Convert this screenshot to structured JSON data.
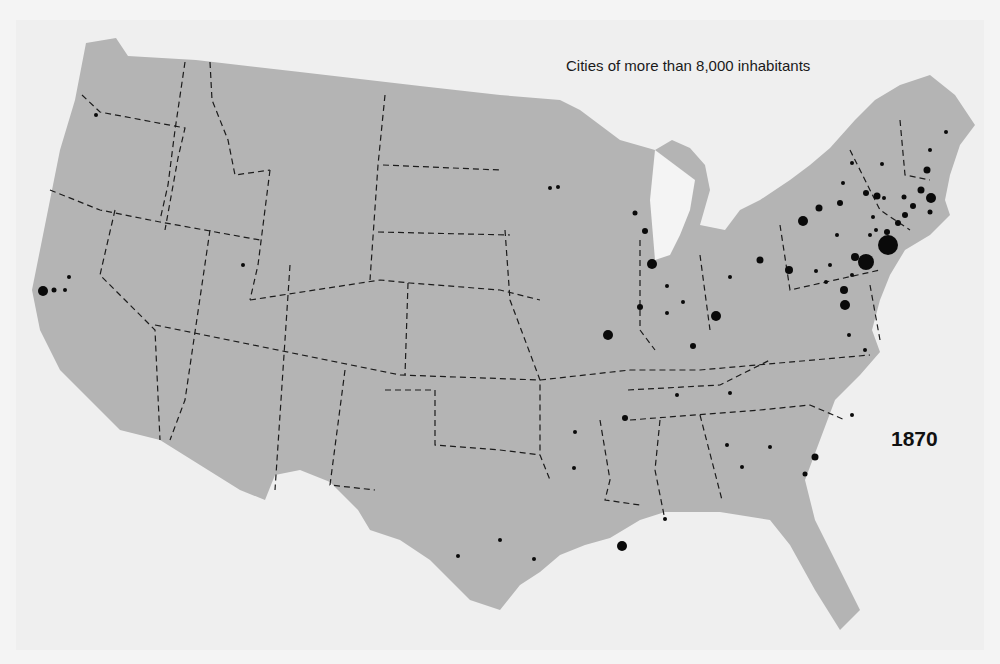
{
  "map": {
    "title": "Cities of more than 8,000 inhabitants",
    "year": "1870",
    "colors": {
      "land": "#b4b4b4",
      "water": "#f4f4f4",
      "city": "#0a0a0a",
      "border": "#1c1c1c"
    },
    "cities": [
      [
        43,
        291,
        6
      ],
      [
        54,
        290,
        3
      ],
      [
        65,
        290,
        2
      ],
      [
        69,
        277,
        2
      ],
      [
        96,
        115,
        2
      ],
      [
        243,
        265,
        2
      ],
      [
        51,
        189,
        2
      ],
      [
        58,
        189,
        2
      ],
      [
        135,
        268,
        3
      ],
      [
        145,
        278,
        3
      ],
      [
        152,
        307,
        5
      ],
      [
        179,
        312,
        7
      ],
      [
        189,
        289,
        2
      ],
      [
        186,
        305,
        2
      ],
      [
        217,
        233,
        3
      ],
      [
        220,
        246,
        2
      ],
      [
        218,
        270,
        2
      ],
      [
        215,
        282,
        3
      ],
      [
        222,
        305,
        2
      ],
      [
        213,
        295,
        2
      ],
      [
        243,
        278,
        2
      ],
      [
        251,
        268,
        2
      ],
      [
        259,
        265,
        5
      ],
      [
        269,
        270,
        2
      ],
      [
        278,
        274,
        3
      ],
      [
        276,
        262,
        2
      ],
      [
        278,
        246,
        2
      ],
      [
        254,
        280,
        3
      ],
      [
        278,
        289,
        2
      ],
      [
        212,
        308,
        4
      ],
      [
        213,
        319,
        3
      ],
      [
        217,
        318,
        2
      ],
      [
        218,
        306,
        2
      ],
      [
        202,
        307,
        2
      ],
      [
        306,
        246,
        2
      ],
      [
        307,
        301,
        3
      ],
      [
        317,
        234,
        2
      ],
      [
        342,
        225,
        2
      ],
      [
        351,
        264,
        2
      ],
      [
        351,
        250,
        3
      ],
      [
        368,
        219,
        2
      ],
      [
        376,
        224,
        2
      ],
      [
        388,
        262,
        6
      ],
      [
        390,
        274,
        3
      ],
      [
        403,
        270,
        2
      ],
      [
        410,
        280,
        2
      ],
      [
        403,
        304,
        2
      ],
      [
        384,
        260,
        2
      ],
      [
        240,
        314,
        2
      ],
      [
        258,
        261,
        2
      ],
      [
        284,
        280,
        5
      ],
      [
        278,
        304,
        3
      ],
      [
        288,
        292,
        2
      ],
      [
        309,
        321,
        2
      ],
      [
        330,
        245,
        2
      ],
      [
        330,
        252,
        2
      ],
      [
        321,
        289,
        2
      ],
      [
        330,
        311,
        3
      ],
      [
        341,
        314,
        3
      ],
      [
        349,
        301,
        3
      ],
      [
        373,
        301,
        2
      ],
      [
        386,
        291,
        2
      ],
      [
        400,
        298,
        2
      ],
      [
        408,
        304,
        2
      ],
      [
        440,
        278,
        2
      ],
      [
        431,
        297,
        4
      ],
      [
        456,
        301,
        2
      ],
      [
        462,
        285,
        2
      ],
      [
        476,
        261,
        3
      ],
      [
        474,
        276,
        3
      ],
      [
        463,
        265,
        2
      ],
      [
        434,
        265,
        2
      ],
      [
        500,
        200,
        2
      ],
      [
        507,
        235,
        5
      ],
      [
        519,
        236,
        2
      ],
      [
        529,
        288,
        2
      ],
      [
        538,
        275,
        2
      ],
      [
        536,
        283,
        2
      ],
      [
        541,
        291,
        2
      ],
      [
        548,
        282,
        3
      ],
      [
        556,
        257,
        2
      ],
      [
        564,
        271,
        2
      ],
      [
        570,
        280,
        2
      ],
      [
        579,
        287,
        2
      ],
      [
        583,
        253,
        2
      ],
      [
        590,
        247,
        3
      ],
      [
        604,
        263,
        3
      ],
      [
        604,
        287,
        5
      ],
      [
        604,
        299,
        2
      ],
      [
        602,
        313,
        2
      ],
      [
        610,
        319,
        2
      ],
      [
        621,
        336,
        3
      ],
      [
        623,
        418,
        2
      ],
      [
        647,
        379,
        3
      ],
      [
        656,
        354,
        2
      ],
      [
        672,
        358,
        2
      ]
    ]
  }
}
